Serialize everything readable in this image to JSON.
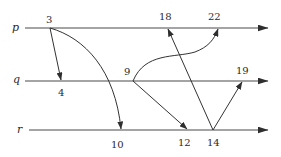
{
  "diagram": {
    "type": "space-time diagram",
    "processes": [
      {
        "id": "p",
        "label": "p",
        "y": 28,
        "x_start": 25,
        "x_end": 268
      },
      {
        "id": "q",
        "label": "q",
        "y": 81,
        "x_start": 25,
        "x_end": 268
      },
      {
        "id": "r",
        "label": "r",
        "y": 130,
        "x_start": 29,
        "x_end": 268
      }
    ],
    "events": [
      {
        "id": "e3",
        "label": "3",
        "process": "p",
        "x": 50
      },
      {
        "id": "e18",
        "label": "18",
        "process": "p",
        "x": 168
      },
      {
        "id": "e22",
        "label": "22",
        "process": "p",
        "x": 218
      },
      {
        "id": "e4",
        "label": "4",
        "process": "q",
        "x": 61
      },
      {
        "id": "e9",
        "label": "9",
        "process": "q",
        "x": 133
      },
      {
        "id": "e19",
        "label": "19",
        "process": "q",
        "x": 242
      },
      {
        "id": "e10",
        "label": "10",
        "process": "r",
        "x": 121
      },
      {
        "id": "e12",
        "label": "12",
        "process": "r",
        "x": 187
      },
      {
        "id": "e14",
        "label": "14",
        "process": "r",
        "x": 213
      }
    ],
    "messages": [
      {
        "from": "3",
        "to": "4",
        "shape": "straight"
      },
      {
        "from": "3",
        "to": "10",
        "shape": "curve"
      },
      {
        "from": "9",
        "to": "22",
        "shape": "curve"
      },
      {
        "from": "9",
        "to": "12",
        "shape": "straight"
      },
      {
        "from": "14",
        "to": "18",
        "shape": "straight"
      },
      {
        "from": "14",
        "to": "19",
        "shape": "straight"
      }
    ],
    "colors": {
      "line": "#3a3a3a",
      "text": "#2a2a2a",
      "background": "#ffffff"
    }
  }
}
